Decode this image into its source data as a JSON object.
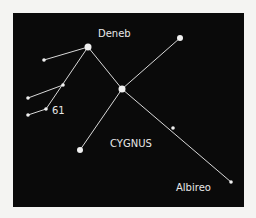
{
  "figure": {
    "title": "CYGNUS",
    "labels": {
      "deneb": "Deneb",
      "sixty_one": "61",
      "constellation": "CYGNUS",
      "albireo": "Albireo"
    },
    "colors": {
      "background": "#0a0a0a",
      "lines": "#d8d8d8",
      "stars": "#f0f0f0",
      "text": "#e8e8e8"
    },
    "stars": [
      {
        "id": "deneb",
        "x": 88,
        "y": 47,
        "r": 3.5
      },
      {
        "id": "top-right",
        "x": 180,
        "y": 38,
        "r": 3
      },
      {
        "id": "sadr",
        "x": 122,
        "y": 89,
        "r": 3.5
      },
      {
        "id": "left-1",
        "x": 44,
        "y": 60,
        "r": 1.8
      },
      {
        "id": "left-2",
        "x": 63,
        "y": 85,
        "r": 1.8
      },
      {
        "id": "left-3",
        "x": 28,
        "y": 98,
        "r": 1.8
      },
      {
        "id": "61-cygni",
        "x": 46,
        "y": 109,
        "r": 1.8
      },
      {
        "id": "left-4",
        "x": 28,
        "y": 115,
        "r": 1.8
      },
      {
        "id": "bottom-left",
        "x": 80,
        "y": 150,
        "r": 3
      },
      {
        "id": "mid-right",
        "x": 173,
        "y": 128,
        "r": 1.8
      },
      {
        "id": "albireo",
        "x": 231,
        "y": 182,
        "r": 1.8
      }
    ]
  }
}
